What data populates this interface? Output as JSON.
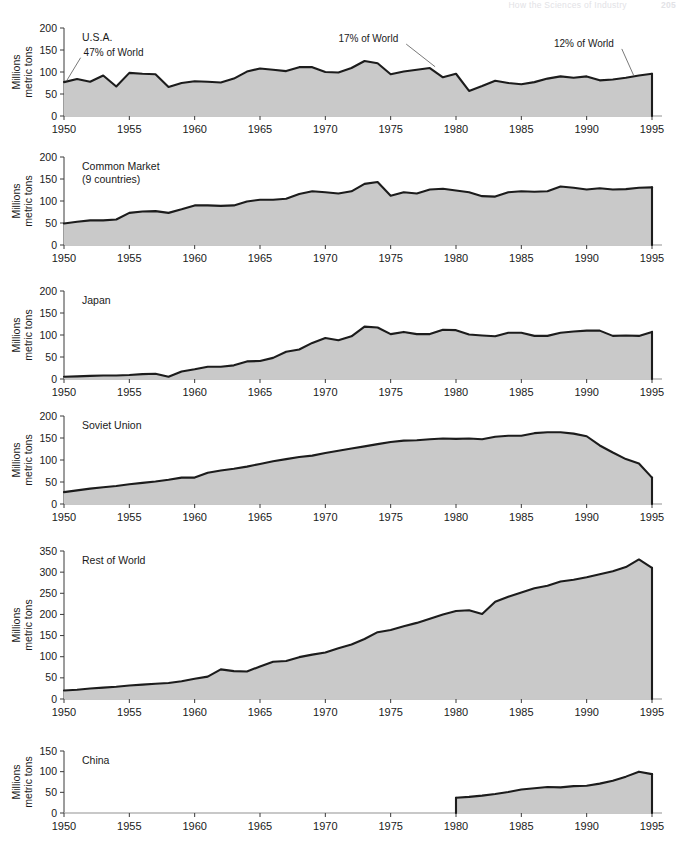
{
  "page_header": {
    "title": "How the Sciences of Industry",
    "page_number": "205"
  },
  "axis_title_line1": "Millions",
  "axis_title_line2": "metric tons",
  "x_ticks": [
    "1950",
    "1955",
    "1960",
    "1965",
    "1970",
    "1975",
    "1980",
    "1985",
    "1990",
    "1995"
  ],
  "colors": {
    "fill": "#c9c9c9",
    "line": "#1c1c1c",
    "axis": "#3a3a3a",
    "leader": "#6a6a6a"
  },
  "chart_data": [
    {
      "type": "area",
      "title": "U.S.A.",
      "xlabel": "",
      "ylabel": "Millions metric tons",
      "xlim": [
        1950,
        1995
      ],
      "ylim": [
        0,
        200
      ],
      "yticks": [
        0,
        50,
        100,
        150,
        200
      ],
      "ytick_labels": [
        "0",
        "50",
        "100",
        "150",
        "200"
      ],
      "xticks": [
        1950,
        1955,
        1960,
        1965,
        1970,
        1975,
        1980,
        1985,
        1990,
        1995
      ],
      "grid": false,
      "legend": "none",
      "x": [
        1950,
        1951,
        1952,
        1953,
        1954,
        1955,
        1956,
        1957,
        1958,
        1959,
        1960,
        1961,
        1962,
        1963,
        1964,
        1965,
        1966,
        1967,
        1968,
        1969,
        1970,
        1971,
        1972,
        1973,
        1974,
        1975,
        1976,
        1977,
        1978,
        1979,
        1980,
        1981,
        1982,
        1983,
        1984,
        1985,
        1986,
        1987,
        1988,
        1989,
        1990,
        1991,
        1992,
        1993,
        1994,
        1995
      ],
      "values": [
        77,
        84,
        78,
        92,
        67,
        98,
        96,
        95,
        66,
        75,
        79,
        78,
        76,
        85,
        101,
        108,
        105,
        102,
        111,
        111,
        100,
        99,
        109,
        125,
        120,
        95,
        101,
        105,
        109,
        88,
        96,
        57,
        68,
        80,
        75,
        72,
        77,
        85,
        90,
        87,
        90,
        81,
        83,
        87,
        92,
        96
      ],
      "annotations": [
        {
          "text": "47% of World",
          "year": 1951.5,
          "value": 137,
          "leader_to_year": 1950.2,
          "leader_to_value": 80
        },
        {
          "text": "17% of World",
          "year": 1971.0,
          "value": 168,
          "leader_to_year": 1978.4,
          "leader_to_value": 112
        },
        {
          "text": "12% of World",
          "year": 1987.5,
          "value": 157,
          "leader_to_year": 1993.6,
          "leader_to_value": 92
        }
      ]
    },
    {
      "type": "area",
      "title": "Common Market",
      "subtitle": "(9 countries)",
      "xlabel": "",
      "ylabel": "Millions metric tons",
      "xlim": [
        1950,
        1995
      ],
      "ylim": [
        0,
        200
      ],
      "yticks": [
        0,
        50,
        100,
        150,
        200
      ],
      "ytick_labels": [
        "0",
        "50",
        "100",
        "150",
        "200"
      ],
      "xticks": [
        1950,
        1955,
        1960,
        1965,
        1970,
        1975,
        1980,
        1985,
        1990,
        1995
      ],
      "grid": false,
      "legend": "none",
      "x": [
        1950,
        1951,
        1952,
        1953,
        1954,
        1955,
        1956,
        1957,
        1958,
        1959,
        1960,
        1961,
        1962,
        1963,
        1964,
        1965,
        1966,
        1967,
        1968,
        1969,
        1970,
        1971,
        1972,
        1973,
        1974,
        1975,
        1976,
        1977,
        1978,
        1979,
        1980,
        1981,
        1982,
        1983,
        1984,
        1985,
        1986,
        1987,
        1988,
        1989,
        1990,
        1991,
        1992,
        1993,
        1994,
        1995
      ],
      "values": [
        49,
        53,
        56,
        56,
        58,
        73,
        76,
        77,
        73,
        81,
        90,
        90,
        89,
        90,
        99,
        103,
        103,
        105,
        116,
        122,
        120,
        117,
        122,
        139,
        143,
        112,
        120,
        117,
        126,
        128,
        124,
        120,
        111,
        110,
        120,
        122,
        121,
        122,
        133,
        130,
        126,
        129,
        126,
        127,
        130,
        131
      ],
      "annotations": []
    },
    {
      "type": "area",
      "title": "Japan",
      "xlabel": "",
      "ylabel": "Millions metric tons",
      "xlim": [
        1950,
        1995
      ],
      "ylim": [
        0,
        200
      ],
      "yticks": [
        0,
        50,
        100,
        150,
        200
      ],
      "ytick_labels": [
        "0",
        "50",
        "100",
        "150",
        "200"
      ],
      "xticks": [
        1950,
        1955,
        1960,
        1965,
        1970,
        1975,
        1980,
        1985,
        1990,
        1995
      ],
      "grid": false,
      "legend": "none",
      "x": [
        1950,
        1951,
        1952,
        1953,
        1954,
        1955,
        1956,
        1957,
        1958,
        1959,
        1960,
        1961,
        1962,
        1963,
        1964,
        1965,
        1966,
        1967,
        1968,
        1969,
        1970,
        1971,
        1972,
        1973,
        1974,
        1975,
        1976,
        1977,
        1978,
        1979,
        1980,
        1981,
        1982,
        1983,
        1984,
        1985,
        1986,
        1987,
        1988,
        1989,
        1990,
        1991,
        1992,
        1993,
        1994,
        1995
      ],
      "values": [
        5,
        6,
        7,
        8,
        8,
        9,
        11,
        12,
        5,
        17,
        22,
        28,
        28,
        31,
        40,
        41,
        48,
        62,
        67,
        82,
        93,
        88,
        97,
        119,
        117,
        102,
        107,
        102,
        102,
        112,
        111,
        101,
        99,
        97,
        105,
        105,
        98,
        98,
        105,
        108,
        110,
        110,
        98,
        99,
        98,
        107
      ],
      "annotations": []
    },
    {
      "type": "area",
      "title": "Soviet Union",
      "xlabel": "",
      "ylabel": "Millions metric tons",
      "xlim": [
        1950,
        1995
      ],
      "ylim": [
        0,
        200
      ],
      "yticks": [
        0,
        50,
        100,
        150,
        200
      ],
      "ytick_labels": [
        "0",
        "50",
        "100",
        "150",
        "200"
      ],
      "xticks": [
        1950,
        1955,
        1960,
        1965,
        1970,
        1975,
        1980,
        1985,
        1990,
        1995
      ],
      "grid": false,
      "legend": "none",
      "x": [
        1950,
        1951,
        1952,
        1953,
        1954,
        1955,
        1956,
        1957,
        1958,
        1959,
        1960,
        1961,
        1962,
        1963,
        1964,
        1965,
        1966,
        1967,
        1968,
        1969,
        1970,
        1971,
        1972,
        1973,
        1974,
        1975,
        1976,
        1977,
        1978,
        1979,
        1980,
        1981,
        1982,
        1983,
        1984,
        1985,
        1986,
        1987,
        1988,
        1989,
        1990,
        1991,
        1992,
        1993,
        1994,
        1995
      ],
      "values": [
        27,
        31,
        35,
        38,
        41,
        45,
        48,
        51,
        55,
        60,
        60,
        71,
        76,
        80,
        85,
        91,
        97,
        102,
        107,
        110,
        116,
        121,
        126,
        131,
        136,
        141,
        144,
        145,
        147,
        149,
        148,
        149,
        147,
        153,
        155,
        155,
        161,
        163,
        163,
        160,
        154,
        133,
        117,
        102,
        92,
        60
      ],
      "annotations": []
    },
    {
      "type": "area",
      "title": "Rest of World",
      "xlabel": "",
      "ylabel": "Millions metric tons",
      "xlim": [
        1950,
        1995
      ],
      "ylim": [
        0,
        350
      ],
      "yticks": [
        0,
        50,
        100,
        150,
        200,
        250,
        300,
        350
      ],
      "ytick_labels": [
        "0",
        "50",
        "100",
        "150",
        "200",
        "250",
        "300",
        "350"
      ],
      "xticks": [
        1950,
        1955,
        1960,
        1965,
        1970,
        1975,
        1980,
        1985,
        1990,
        1995
      ],
      "grid": false,
      "legend": "none",
      "x": [
        1950,
        1951,
        1952,
        1953,
        1954,
        1955,
        1956,
        1957,
        1958,
        1959,
        1960,
        1961,
        1962,
        1963,
        1964,
        1965,
        1966,
        1967,
        1968,
        1969,
        1970,
        1971,
        1972,
        1973,
        1974,
        1975,
        1976,
        1977,
        1978,
        1979,
        1980,
        1981,
        1982,
        1983,
        1984,
        1985,
        1986,
        1987,
        1988,
        1989,
        1990,
        1991,
        1992,
        1993,
        1994,
        1995
      ],
      "values": [
        20,
        22,
        25,
        27,
        29,
        32,
        34,
        36,
        38,
        42,
        48,
        53,
        70,
        66,
        65,
        77,
        88,
        90,
        99,
        105,
        110,
        120,
        129,
        142,
        158,
        163,
        172,
        180,
        190,
        200,
        208,
        210,
        201,
        230,
        242,
        252,
        262,
        268,
        278,
        282,
        288,
        295,
        302,
        312,
        330,
        310
      ],
      "annotations": []
    },
    {
      "type": "area",
      "title": "China",
      "xlabel": "",
      "ylabel": "Millions metric tons",
      "xlim": [
        1950,
        1995
      ],
      "ylim": [
        0,
        150
      ],
      "yticks": [
        0,
        50,
        100,
        150
      ],
      "ytick_labels": [
        "0",
        "50",
        "100",
        "150"
      ],
      "xticks": [
        1950,
        1955,
        1960,
        1965,
        1970,
        1975,
        1980,
        1985,
        1990,
        1995
      ],
      "grid": false,
      "legend": "none",
      "x": [
        1980,
        1981,
        1982,
        1983,
        1984,
        1985,
        1986,
        1987,
        1988,
        1989,
        1990,
        1991,
        1992,
        1993,
        1994,
        1995
      ],
      "values": [
        37,
        39,
        42,
        46,
        51,
        57,
        60,
        63,
        62,
        65,
        66,
        71,
        78,
        88,
        100,
        94
      ],
      "data_start_year": 1980,
      "annotations": []
    }
  ]
}
